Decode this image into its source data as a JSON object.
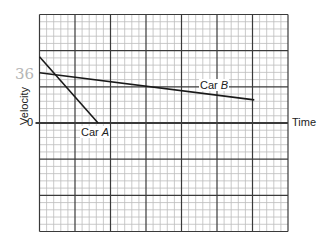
{
  "chart_data": {
    "type": "line",
    "title": "",
    "xlabel": "Time",
    "ylabel": "Velocity",
    "y_tick_labels": [
      "0"
    ],
    "grid": true,
    "grid_major_cols": 7,
    "grid_major_rows": 6,
    "grid_minor_per_major": 5,
    "zero_row_from_top": 3,
    "xlim": [
      0,
      7
    ],
    "ylim": [
      -3,
      3
    ],
    "series": [
      {
        "name": "Car A",
        "label": "Car A",
        "points": [
          [
            0,
            1.83
          ],
          [
            1.65,
            0
          ]
        ]
      },
      {
        "name": "Car B",
        "label": "Car B",
        "points": [
          [
            0,
            1.39
          ],
          [
            6.05,
            0.64
          ]
        ]
      }
    ],
    "annotations": [
      {
        "text": "36",
        "note": "handwritten near Car B intercept",
        "x": -0.55,
        "y": 1.35
      }
    ]
  },
  "labels": {
    "time": "Time",
    "velocity": "Velocity",
    "zero": "0",
    "car_a_prefix": "Car ",
    "car_a_letter": "A",
    "car_b_prefix": "Car ",
    "car_b_letter": "B",
    "handwritten": "36"
  },
  "colors": {
    "minor_grid": "#bdbdbd",
    "major_grid": "#3a3a3a",
    "line": "#1a1a1a",
    "handwriting": "#b5b5b5"
  }
}
